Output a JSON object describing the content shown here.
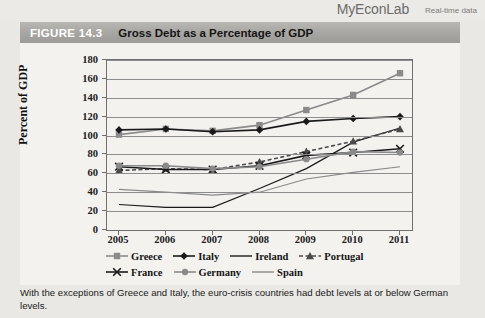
{
  "brand": {
    "name": "MyEconLab",
    "tagline": "Real-time data"
  },
  "figure": {
    "number": "FIGURE 14.3",
    "title": "Gross Debt as a Percentage of GDP"
  },
  "caption": "With the exceptions of Greece and Italy, the euro-crisis countries had debt levels at or below German levels.",
  "chart_data": {
    "type": "line",
    "title": "Gross Debt as a Percentage of GDP",
    "xlabel": "",
    "ylabel": "Percent of GDP",
    "x": [
      "2005",
      "2006",
      "2007",
      "2008",
      "2009",
      "2010",
      "2011"
    ],
    "ylim": [
      0,
      180
    ],
    "ytick_step": 20,
    "yticks": [
      "0",
      "20",
      "40",
      "60",
      "80",
      "100",
      "120",
      "140",
      "160",
      "180"
    ],
    "grid": true,
    "legend_position": "below",
    "series": [
      {
        "name": "Greece",
        "values": [
          101,
          107,
          105,
          111,
          127,
          143,
          166
        ],
        "color": "#8a8a8a",
        "marker": "square",
        "dash": false
      },
      {
        "name": "Italy",
        "values": [
          106,
          107,
          104,
          106,
          115,
          118,
          120
        ],
        "color": "#1a1a1a",
        "marker": "diamond",
        "dash": false
      },
      {
        "name": "Ireland",
        "values": [
          27,
          24,
          24,
          44,
          65,
          93,
          108
        ],
        "color": "#1a1a1a",
        "marker": "none",
        "dash": false
      },
      {
        "name": "Portugal",
        "values": [
          63,
          65,
          64,
          72,
          83,
          94,
          107
        ],
        "color": "#4a4a4a",
        "marker": "triangle",
        "dash": true
      },
      {
        "name": "France",
        "values": [
          67,
          64,
          64,
          68,
          79,
          82,
          86
        ],
        "color": "#1a1a1a",
        "marker": "cross",
        "dash": false
      },
      {
        "name": "Germany",
        "values": [
          68,
          68,
          65,
          67,
          75,
          83,
          82
        ],
        "color": "#8a8a8a",
        "marker": "circle",
        "dash": false
      },
      {
        "name": "Spain",
        "values": [
          43,
          40,
          37,
          40,
          54,
          61,
          67
        ],
        "color": "#8a8a8a",
        "marker": "none",
        "dash": false
      }
    ]
  }
}
